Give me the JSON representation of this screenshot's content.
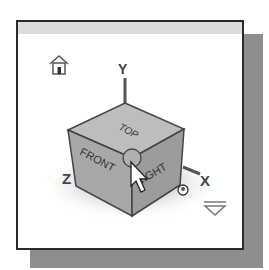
{
  "viewcube": {
    "faces": {
      "top": "TOP",
      "front": "FRONT",
      "right": "RIGHT"
    },
    "axes": {
      "x": "X",
      "y": "Y",
      "z": "Z"
    },
    "home_icon": "home-icon",
    "menu_icon": "chevron-down-icon",
    "cursor_icon": "arrow-cursor-icon",
    "orbit_icon": "orbit-sphere-icon"
  },
  "colors": {
    "frame_border": "#2a2a2a",
    "shadow": "#8e8e8e",
    "header": "#dcdcdc",
    "cube_face": "#a8a8a8",
    "cube_top": "#bdbdbd"
  }
}
